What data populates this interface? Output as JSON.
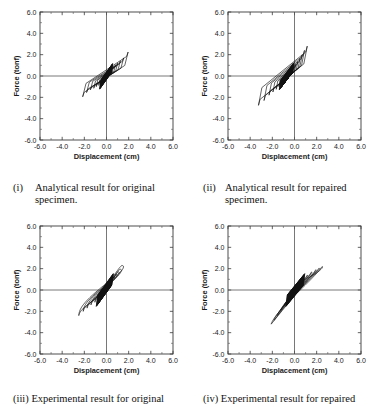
{
  "figure": {
    "panel_count": 4,
    "columns": 2,
    "rows": 2
  },
  "axes": {
    "xlabel": "Displacement (cm)",
    "ylabel": "Force (tonf)",
    "xlim": [
      -6.0,
      6.0
    ],
    "ylim": [
      -6.0,
      6.0
    ],
    "xticks": [
      -6.0,
      -4.0,
      -2.0,
      0.0,
      2.0,
      4.0,
      6.0
    ],
    "yticks": [
      -6.0,
      -4.0,
      -2.0,
      0.0,
      2.0,
      4.0,
      6.0
    ],
    "xticklabels": [
      "-6.0",
      "-4.0",
      "-2.0",
      "0.0",
      "2.0",
      "4.0",
      "6.0"
    ],
    "yticklabels": [
      "-6.0",
      "-4.0",
      "-2.0",
      "0.0",
      "2.0",
      "4.0",
      "6.0"
    ],
    "minor_ticks_between": 1,
    "tick_direction": "in",
    "grid": false,
    "zero_axis_lines": true,
    "frame_color": "#3a3a3a",
    "curve_color": "#111111",
    "background": "#ffffff"
  },
  "captions": {
    "i": {
      "num": "(i)",
      "line1": "Analytical result for original",
      "line2": "specimen."
    },
    "ii": {
      "num": "(ii)",
      "line1": "Analytical result for repaired",
      "line2": "specimen."
    },
    "iii": {
      "num": "(iii)",
      "line1": "Experimental result for original"
    },
    "iv": {
      "num": "(iv)",
      "line1": "Experimental result for repaired"
    }
  },
  "chart_data": [
    {
      "id": "panel-i",
      "type": "line",
      "title": "Analytical result for original specimen",
      "xlabel": "Displacement (cm)",
      "ylabel": "Force (tonf)",
      "xlim": [
        -6.0,
        6.0
      ],
      "ylim": [
        -6.0,
        6.0
      ],
      "legend": "none",
      "grid": false,
      "description": "Nested angular parallelogram hysteresis loops, sheared along a positive stiffness axis, with a dense black cluster of small cycles at the origin.",
      "loop_style": "angular",
      "cycles": [
        {
          "name": "cycle-1",
          "xmax": 0.18,
          "xmin": -0.2,
          "fmax": 0.38,
          "fmin": -0.4,
          "shear": 0.06,
          "width": 0.05
        },
        {
          "name": "cycle-2",
          "xmax": 0.3,
          "xmin": -0.33,
          "fmax": 0.55,
          "fmin": -0.55,
          "shear": 0.09,
          "width": 0.08
        },
        {
          "name": "cycle-3",
          "xmax": 0.45,
          "xmin": -0.5,
          "fmax": 0.72,
          "fmin": -0.72,
          "shear": 0.12,
          "width": 0.12
        },
        {
          "name": "cycle-4",
          "xmax": 0.62,
          "xmin": -0.7,
          "fmax": 0.9,
          "fmin": -0.88,
          "shear": 0.16,
          "width": 0.17
        },
        {
          "name": "cycle-5",
          "xmax": 0.8,
          "xmin": -0.92,
          "fmax": 1.05,
          "fmin": -1.0,
          "shear": 0.2,
          "width": 0.23
        },
        {
          "name": "cycle-6",
          "xmax": 1.0,
          "xmin": -1.15,
          "fmax": 1.2,
          "fmin": -1.15,
          "shear": 0.24,
          "width": 0.3
        },
        {
          "name": "cycle-7",
          "xmax": 1.25,
          "xmin": -1.45,
          "fmax": 1.4,
          "fmin": -1.3,
          "shear": 0.28,
          "width": 0.38
        },
        {
          "name": "cycle-8",
          "xmax": 1.55,
          "xmin": -1.8,
          "fmax": 1.7,
          "fmin": -1.55,
          "shear": 0.32,
          "width": 0.46
        },
        {
          "name": "cycle-9",
          "xmax": 1.95,
          "xmin": -2.15,
          "fmax": 2.25,
          "fmin": -1.95,
          "shear": 0.36,
          "width": 0.55
        }
      ],
      "peak_force_positive": 2.25,
      "peak_force_negative": -1.95,
      "peak_displacement_positive": 1.95,
      "peak_displacement_negative": -2.15
    },
    {
      "id": "panel-ii",
      "type": "line",
      "title": "Analytical result for repaired specimen",
      "xlabel": "Displacement (cm)",
      "ylabel": "Force (tonf)",
      "xlim": [
        -6.0,
        6.0
      ],
      "ylim": [
        -6.0,
        6.0
      ],
      "legend": "none",
      "grid": false,
      "description": "Nested angular hysteresis loops shifted toward negative displacement, steeper slope, largest loop reaching about +2.8 tonf at +1.6 cm and -2.8 tonf at -2.8 cm.",
      "loop_style": "angular",
      "offset_x": -0.45,
      "cycles": [
        {
          "name": "cycle-1",
          "xmax": 0.12,
          "xmin": -0.3,
          "fmax": 0.4,
          "fmin": -0.42,
          "shear": 0.05,
          "width": 0.05
        },
        {
          "name": "cycle-2",
          "xmax": 0.25,
          "xmin": -0.48,
          "fmax": 0.62,
          "fmin": -0.6,
          "shear": 0.08,
          "width": 0.09
        },
        {
          "name": "cycle-3",
          "xmax": 0.4,
          "xmin": -0.7,
          "fmax": 0.85,
          "fmin": -0.8,
          "shear": 0.11,
          "width": 0.14
        },
        {
          "name": "cycle-4",
          "xmax": 0.58,
          "xmin": -0.95,
          "fmax": 1.1,
          "fmin": -1.0,
          "shear": 0.14,
          "width": 0.2
        },
        {
          "name": "cycle-5",
          "xmax": 0.75,
          "xmin": -1.2,
          "fmax": 1.35,
          "fmin": -1.25,
          "shear": 0.17,
          "width": 0.26
        },
        {
          "name": "cycle-6",
          "xmax": 0.95,
          "xmin": -1.5,
          "fmax": 1.65,
          "fmin": -1.5,
          "shear": 0.2,
          "width": 0.33
        },
        {
          "name": "cycle-7",
          "xmax": 1.15,
          "xmin": -1.85,
          "fmax": 2.0,
          "fmin": -1.8,
          "shear": 0.23,
          "width": 0.4
        },
        {
          "name": "cycle-8",
          "xmax": 1.35,
          "xmin": -2.3,
          "fmax": 2.4,
          "fmin": -2.3,
          "shear": 0.26,
          "width": 0.48
        },
        {
          "name": "cycle-9",
          "xmax": 1.6,
          "xmin": -2.8,
          "fmax": 2.8,
          "fmin": -2.75,
          "shear": 0.28,
          "width": 0.56
        }
      ],
      "peak_force_positive": 2.8,
      "peak_force_negative": -2.75,
      "peak_displacement_positive": 1.6,
      "peak_displacement_negative": -2.8
    },
    {
      "id": "panel-iii",
      "type": "line",
      "title": "Experimental result for original specimen",
      "xlabel": "Displacement (cm)",
      "ylabel": "Force (tonf)",
      "xlim": [
        -6.0,
        6.0
      ],
      "ylim": [
        -6.0,
        6.0
      ],
      "legend": "none",
      "grid": false,
      "description": "Broad rounded-corner experimental hysteresis loops, fatter than the analytical ones, with a solid black pinched core at the origin; largest loop about +2.3 tonf at +1.6 cm and -2.4 tonf at -2.5 cm.",
      "loop_style": "rounded",
      "cycles": [
        {
          "name": "cycle-1",
          "xmax": 0.2,
          "xmin": -0.3,
          "fmax": 0.5,
          "fmin": -0.5,
          "shear": 0.05,
          "width": 0.07
        },
        {
          "name": "cycle-2",
          "xmax": 0.35,
          "xmin": -0.5,
          "fmax": 0.72,
          "fmin": -0.7,
          "shear": 0.09,
          "width": 0.13
        },
        {
          "name": "cycle-3",
          "xmax": 0.55,
          "xmin": -0.75,
          "fmax": 0.95,
          "fmin": -0.92,
          "shear": 0.13,
          "width": 0.21
        },
        {
          "name": "cycle-4",
          "xmax": 0.78,
          "xmin": -1.05,
          "fmax": 1.2,
          "fmin": -1.15,
          "shear": 0.17,
          "width": 0.3
        },
        {
          "name": "cycle-5",
          "xmax": 1.0,
          "xmin": -1.4,
          "fmax": 1.45,
          "fmin": -1.4,
          "shear": 0.21,
          "width": 0.4
        },
        {
          "name": "cycle-6",
          "xmax": 1.2,
          "xmin": -1.75,
          "fmax": 1.7,
          "fmin": -1.7,
          "shear": 0.25,
          "width": 0.5
        },
        {
          "name": "cycle-7",
          "xmax": 1.4,
          "xmin": -2.1,
          "fmax": 1.95,
          "fmin": -2.0,
          "shear": 0.29,
          "width": 0.6
        },
        {
          "name": "cycle-8",
          "xmax": 1.6,
          "xmin": -2.5,
          "fmax": 2.3,
          "fmin": -2.4,
          "shear": 0.32,
          "width": 0.72
        }
      ],
      "peak_force_positive": 2.3,
      "peak_force_negative": -2.4,
      "peak_displacement_positive": 1.6,
      "peak_displacement_negative": -2.5
    },
    {
      "id": "panel-iv",
      "type": "line",
      "title": "Experimental result for repaired specimen",
      "xlabel": "Displacement (cm)",
      "ylabel": "Force (tonf)",
      "xlim": [
        -6.0,
        6.0
      ],
      "ylim": [
        -6.0,
        6.0
      ],
      "legend": "none",
      "grid": false,
      "description": "Smooth S-shaped pinched elliptical hysteresis loops tilted steeply, reaching about +2.2 tonf at +2.6 cm and -3.2 tonf at -2.1 cm, with a dark pinched core at the origin.",
      "loop_style": "pinched",
      "cycles": [
        {
          "name": "cycle-1",
          "xmax": 0.3,
          "xmin": -0.25,
          "fmax": 0.5,
          "fmin": -0.5,
          "shear": 0.06,
          "width": 0.06
        },
        {
          "name": "cycle-2",
          "xmax": 0.55,
          "xmin": -0.45,
          "fmax": 0.8,
          "fmin": -0.78,
          "shear": 0.1,
          "width": 0.1
        },
        {
          "name": "cycle-3",
          "xmax": 0.85,
          "xmin": -0.7,
          "fmax": 1.1,
          "fmin": -1.1,
          "shear": 0.14,
          "width": 0.16
        },
        {
          "name": "cycle-4",
          "xmax": 1.2,
          "xmin": -0.95,
          "fmax": 1.4,
          "fmin": -1.45,
          "shear": 0.18,
          "width": 0.22
        },
        {
          "name": "cycle-5",
          "xmax": 1.6,
          "xmin": -1.25,
          "fmax": 1.7,
          "fmin": -1.9,
          "shear": 0.22,
          "width": 0.3
        },
        {
          "name": "cycle-6",
          "xmax": 2.0,
          "xmin": -1.55,
          "fmax": 1.9,
          "fmin": -2.4,
          "shear": 0.26,
          "width": 0.38
        },
        {
          "name": "cycle-7",
          "xmax": 2.3,
          "xmin": -1.85,
          "fmax": 2.05,
          "fmin": -2.85,
          "shear": 0.3,
          "width": 0.46
        },
        {
          "name": "cycle-8",
          "xmax": 2.6,
          "xmin": -2.1,
          "fmax": 2.2,
          "fmin": -3.2,
          "shear": 0.33,
          "width": 0.54
        }
      ],
      "peak_force_positive": 2.2,
      "peak_force_negative": -3.2,
      "peak_displacement_positive": 2.6,
      "peak_displacement_negative": -2.1
    }
  ]
}
